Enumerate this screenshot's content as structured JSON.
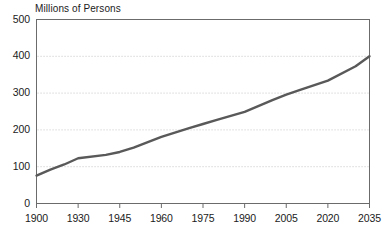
{
  "chart_data": {
    "type": "line",
    "title": "",
    "subtitle": "",
    "ylabel": "Millions of Persons",
    "xlabel": "",
    "ylim": [
      0,
      500
    ],
    "xlim": [
      1900,
      2035
    ],
    "grid": true,
    "legend": null,
    "y_ticks": [
      0,
      100,
      200,
      300,
      400,
      500
    ],
    "y_tick_labels": [
      "0",
      "100",
      "200",
      "300",
      "400",
      "500"
    ],
    "x_ticks": [
      1900,
      1930,
      1945,
      1960,
      1975,
      1990,
      2005,
      2020,
      2035
    ],
    "x_tick_labels": [
      "1900",
      "1930",
      "1945",
      "1960",
      "1975",
      "1990",
      "2005",
      "2020",
      "2035"
    ],
    "series": [
      {
        "name": "Population",
        "color": "#595959",
        "x": [
          1900,
          1910,
          1920,
          1930,
          1940,
          1945,
          1950,
          1960,
          1970,
          1975,
          1980,
          1990,
          2000,
          2005,
          2010,
          2020,
          2030,
          2035
        ],
        "values": [
          76,
          92,
          106,
          123,
          132,
          140,
          152,
          181,
          205,
          216,
          227,
          249,
          281,
          296,
          309,
          334,
          373,
          400
        ]
      }
    ]
  },
  "axis": {
    "y_title": "Millions of Persons"
  },
  "colors": {
    "line": "#595959",
    "grid": "#c9c9c9",
    "axis": "#6b6b6b",
    "text": "#1b1b1b"
  }
}
